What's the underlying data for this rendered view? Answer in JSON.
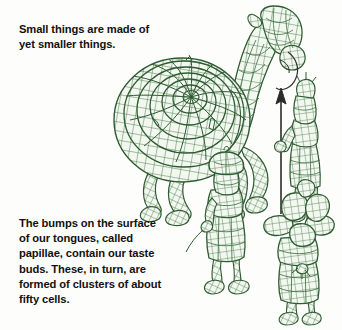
{
  "page": {
    "width": 342,
    "height": 330,
    "background_color": "#fdfdfb"
  },
  "captions": {
    "top": {
      "text": "Small things are made of\nyet smaller things.",
      "color": "#111111"
    },
    "bottom": {
      "text": "The bumps on the surface\nof our tongues, called\npapillae, contain our taste\nbuds. These, in turn, are\nformed of clusters of about\nfifty cells.",
      "color": "#111111"
    }
  },
  "illustration": {
    "name": "mesh-wireframe-camel-and-figures",
    "style": "green wireframe mesh line drawing",
    "line_color": "#2f5b33",
    "fill_color": "#f2f7ef",
    "accent_color": "#44773f",
    "ink_color": "#1d1d1d",
    "subjects": [
      {
        "name": "spiral-shell-camel",
        "description": "large camel-like creature whose body is a spiral concentric mesh shell resembling a tongue papilla"
      },
      {
        "name": "spear-figure",
        "description": "standing mesh figure holding an upright spear"
      },
      {
        "name": "walking-figure",
        "description": "mesh figure with rounded cap walking forward"
      },
      {
        "name": "flower-hat-figure",
        "description": "mesh figure wearing a broad petal-like flower hat"
      }
    ]
  }
}
